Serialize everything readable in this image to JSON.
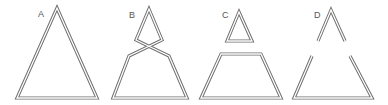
{
  "figure": {
    "stroke_color": "#6e6e6e",
    "background": "#ffffff",
    "panels": [
      {
        "label": "A",
        "label_pos": [
          38,
          17
        ],
        "description": "single closed triangle",
        "paths": [
          {
            "points": "57,8 97,98 17,98",
            "closed": true
          }
        ]
      },
      {
        "label": "B",
        "label_pos": [
          129,
          18
        ],
        "description": "triangle pinched and crossed into a small upper loop and a trapezoid",
        "paths": [
          {
            "points": "149,9 162,40 129,56 113,98 187,98 169,56 136,40",
            "closed": true
          }
        ]
      },
      {
        "label": "C",
        "label_pos": [
          222,
          18
        ],
        "description": "separated into a small closed triangle and a closed trapezoid",
        "paths": [
          {
            "points": "239,12 252,41 227,41",
            "closed": true
          },
          {
            "points": "221,54 261,54 281,98 201,98",
            "closed": true
          }
        ]
      },
      {
        "label": "D",
        "label_pos": [
          314,
          18
        ],
        "description": "separated into an open upper caret and an open lower trapezoid",
        "paths": [
          {
            "points": "318,41 331,10 345,41",
            "closed": false
          },
          {
            "points": "312,56 294,98 372,98 350,56",
            "closed": false
          }
        ]
      }
    ]
  }
}
